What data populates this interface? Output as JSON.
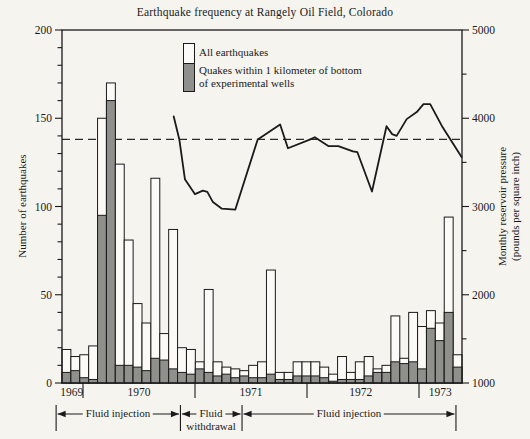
{
  "title": "Earthquake frequency at Rangely Oil Field, Colorado",
  "legend": {
    "all_label": "All earthquakes",
    "inner_label_line1": "Quakes within 1 kilometer of bottom",
    "inner_label_line2": "of experimental wells"
  },
  "axes": {
    "left": {
      "label": "Number of earthquakes",
      "tick_labels": [
        "0",
        "50",
        "100",
        "150",
        "200"
      ],
      "major_ticks": [
        0,
        50,
        100,
        150,
        200
      ],
      "minor_step": 10,
      "range": [
        0,
        200
      ]
    },
    "right": {
      "label_line1": "Monthly reservoir pressure",
      "label_line2": "(pounds per square inch)",
      "tick_labels": [
        "1000",
        "2000",
        "3000",
        "4000",
        "5000"
      ],
      "major_ticks": [
        1000,
        2000,
        3000,
        4000,
        5000
      ],
      "minor_step": 500,
      "range": [
        1000,
        5000
      ]
    },
    "x": {
      "year_boundary_ticks": [
        1970,
        1971,
        1972,
        1973
      ],
      "year_labels": [
        {
          "text": "1969",
          "center_year": 1969.9
        },
        {
          "text": "1970",
          "center_year": 1970.5
        },
        {
          "text": "1971",
          "center_year": 1971.5
        },
        {
          "text": "1972",
          "center_year": 1972.48
        },
        {
          "text": "1973",
          "center_year": 1973.19
        }
      ],
      "range_year": [
        1969.8125,
        1973.384
      ]
    },
    "chart_note": "histogram bars are monthly counts; curve read against right axis",
    "year_of_first_bar": 1969
  },
  "chart_data": {
    "type": "combo-bar-line",
    "bar_start_year": 1969.8125,
    "bar_width_years": 0.07937,
    "bar_series": [
      {
        "name": "All earthquakes",
        "values": [
          19,
          15,
          16,
          21,
          150,
          170,
          124,
          81,
          45,
          34,
          116,
          28,
          87,
          20,
          19,
          12,
          53,
          12,
          9,
          8,
          7,
          10,
          12,
          64,
          6,
          6,
          12,
          12,
          12,
          9,
          5,
          15,
          6,
          12,
          15,
          8,
          10,
          38,
          14,
          40,
          32,
          41,
          34,
          94,
          16
        ]
      },
      {
        "name": "Quakes within 1 kilometer of bottom of experimental wells",
        "values": [
          6,
          7,
          3,
          2,
          95,
          160,
          10,
          10,
          9,
          7,
          14,
          13,
          8,
          6,
          5,
          8,
          6,
          4,
          5,
          3,
          4,
          3,
          3,
          5,
          2,
          2,
          4,
          4,
          4,
          3,
          1,
          2,
          2,
          2,
          4,
          6,
          6,
          12,
          11,
          12,
          8,
          31,
          24,
          40,
          9
        ]
      }
    ],
    "line_series": {
      "name": "Monthly reservoir pressure (psi)",
      "x_year": [
        1970.81,
        1970.86,
        1970.91,
        1971.0,
        1971.07,
        1971.11,
        1971.16,
        1971.24,
        1971.36,
        1971.56,
        1971.76,
        1971.83,
        1972.03,
        1972.07,
        1972.19,
        1972.28,
        1972.41,
        1972.45,
        1972.58,
        1972.71,
        1972.76,
        1972.8,
        1972.89,
        1972.98,
        1973.04,
        1973.1,
        1973.21,
        1973.38
      ],
      "psi": [
        4020,
        3760,
        3310,
        3140,
        3180,
        3165,
        3050,
        2975,
        2965,
        3760,
        3930,
        3660,
        3760,
        3785,
        3685,
        3685,
        3625,
        3615,
        3170,
        3910,
        3820,
        3800,
        3990,
        4070,
        4160,
        4160,
        3900,
        3560
      ]
    },
    "threshold_dashed_psi": 3760,
    "ylim_left": [
      0,
      200
    ],
    "ylim_right": [
      1000,
      5000
    ]
  },
  "annotations": {
    "segments": [
      {
        "label": "Fluid injection",
        "from_year": 1969.76,
        "to_year": 1970.87
      },
      {
        "label_line1": "Fluid",
        "label_line2": "withdrawal",
        "from_year": 1970.87,
        "to_year": 1971.42
      },
      {
        "label": "Fluid injection",
        "from_year": 1971.42,
        "to_year": 1973.33
      }
    ]
  },
  "colors": {
    "background": "#f5f4ef",
    "bar_all_fill": "#fbfaf6",
    "bar_inner_fill": "#8f908c",
    "ink": "#1a1a1a",
    "dashed_line": "#2a2a2a"
  }
}
